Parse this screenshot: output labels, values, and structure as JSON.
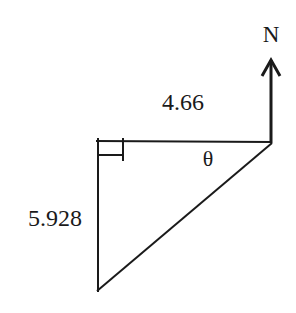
{
  "diagram": {
    "type": "right-triangle bearing diagram",
    "north_label": "N",
    "top_side_label": "4.66",
    "left_side_label": "5.928",
    "angle_label": "θ",
    "right_angle_marker": true,
    "colors": {
      "line": "#1a1a1a",
      "background": "#ffffff"
    },
    "vertices": {
      "top_left": [
        98,
        141
      ],
      "top_right": [
        271,
        142
      ],
      "bottom_left": [
        97,
        291
      ]
    }
  }
}
